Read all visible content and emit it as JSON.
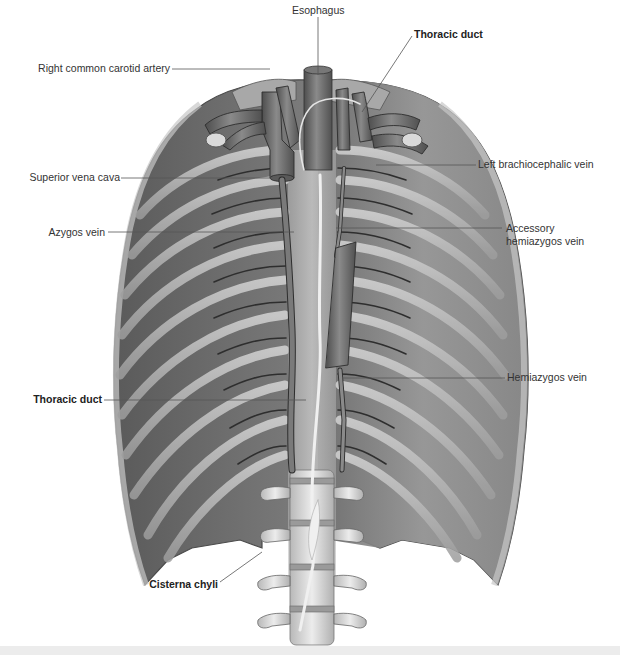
{
  "figure": {
    "type": "anatomical illustration",
    "view": "posterior thoracic wall, anterior view",
    "palette": {
      "background": "#ffffff",
      "muscle": "#7b7b7b",
      "muscle_dark": "#5e5e5e",
      "rib": "#bdbdbd",
      "vessel": "#6a6a6a",
      "vessel_outline": "#333333",
      "bone": "#d9d9d9",
      "duct": "#e6e6e6",
      "leader_line": "#555555",
      "label_text": "#333333",
      "footer_band": "#ececec"
    }
  },
  "labels": {
    "esophagus": "Esophagus",
    "thoracic_duct_top": "Thoracic duct",
    "right_common_carotid_artery": "Right common carotid artery",
    "left_brachiocephalic_vein": "Left brachiocephalic vein",
    "superior_vena_cava": "Superior vena cava",
    "azygos_vein": "Azygos vein",
    "accessory_hemiazygos_vein_line1": "Accessory",
    "accessory_hemiazygos_vein_line2": "hemiazygos vein",
    "hemiazygos_vein": "Hemiazygos vein",
    "thoracic_duct_left": "Thoracic duct",
    "cisterna_chyli": "Cisterna chyli"
  },
  "bold_labels": [
    "Thoracic duct",
    "Thoracic duct",
    "Cisterna chyli"
  ]
}
